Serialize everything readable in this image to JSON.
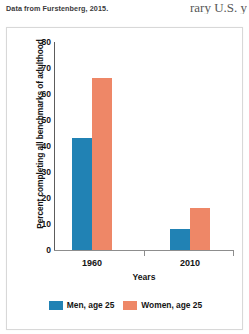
{
  "page": {
    "source_note": "Data from Furstenberg, 2015.",
    "body_text_fragment": "rary U.S. y"
  },
  "chart_data": {
    "type": "bar",
    "title": "",
    "xlabel": "Years",
    "ylabel": "Percent completing all benchmarks of adulthood",
    "categories": [
      "1960",
      "2010"
    ],
    "series": [
      {
        "name": "Men, age 25",
        "color": "#2182b4",
        "values": [
          43,
          8
        ]
      },
      {
        "name": "Women, age 25",
        "color": "#ee8767",
        "values": [
          66,
          16
        ]
      }
    ],
    "ylim": [
      0,
      85
    ],
    "yticks": [
      80,
      70,
      60,
      50,
      40,
      30,
      20,
      10,
      0
    ],
    "grid": false,
    "legend_position": "bottom"
  },
  "legend": {
    "items": [
      {
        "label": "Men, age 25"
      },
      {
        "label": "Women, age 25"
      }
    ]
  },
  "axis": {
    "y_labels": [
      "80",
      "70",
      "60",
      "50",
      "40",
      "30",
      "20",
      "10",
      "0"
    ],
    "x_labels": [
      "1960",
      "2010"
    ]
  }
}
